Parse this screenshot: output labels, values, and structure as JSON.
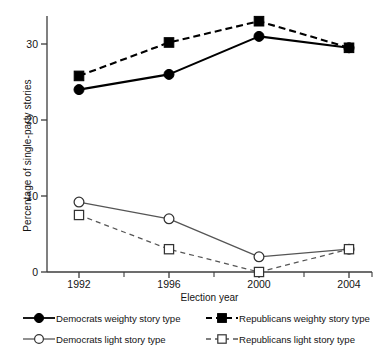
{
  "chart_data": {
    "type": "line",
    "title": "",
    "xlabel": "Election year",
    "ylabel": "Percentage of single-party stories",
    "categories": [
      "1992",
      "1996",
      "2000",
      "2004"
    ],
    "x": [
      1992,
      1996,
      2000,
      2004
    ],
    "ylim": [
      0,
      34
    ],
    "yticks": [
      0,
      10,
      20,
      30
    ],
    "ytick_labels": [
      "0",
      "10",
      "20",
      "30"
    ],
    "xtick_labels": [
      "1992",
      "1996",
      "2000",
      "2004"
    ],
    "grid": false,
    "legend_position": "below-axes",
    "series": [
      {
        "name": "Democrats weighty story type",
        "values": [
          24.0,
          26.0,
          31.0,
          29.5
        ],
        "marker": "filled-circle",
        "line": "solid",
        "color": "#000000"
      },
      {
        "name": "Republicans weighty story type",
        "values": [
          25.8,
          30.2,
          33.0,
          29.5
        ],
        "marker": "filled-square",
        "line": "dashed",
        "color": "#000000"
      },
      {
        "name": "Democrats light story type",
        "values": [
          9.2,
          7.0,
          2.0,
          3.0
        ],
        "marker": "open-circle",
        "line": "solid",
        "color": "#555555"
      },
      {
        "name": "Republicans light story type",
        "values": [
          7.5,
          3.0,
          0.0,
          3.0
        ],
        "marker": "open-square",
        "line": "dashed",
        "color": "#555555"
      }
    ]
  },
  "axes": {
    "ylabel": "Percentage of single-party stories",
    "xlabel": "Election year",
    "ytick_0": "0",
    "ytick_1": "10",
    "ytick_2": "20",
    "ytick_3": "30",
    "xtick_0": "1992",
    "xtick_1": "1996",
    "xtick_2": "2000",
    "xtick_3": "2004"
  },
  "legend": {
    "dem_weighty": "Democrats weighty story type",
    "rep_weighty": "Republicans weighty story type",
    "dem_light": "Democrats light story type",
    "rep_light": "Republicans light story type"
  },
  "colors": {
    "weighty": "#000000",
    "light": "#555555",
    "axis": "#3c3c3c",
    "background": "#ffffff"
  }
}
